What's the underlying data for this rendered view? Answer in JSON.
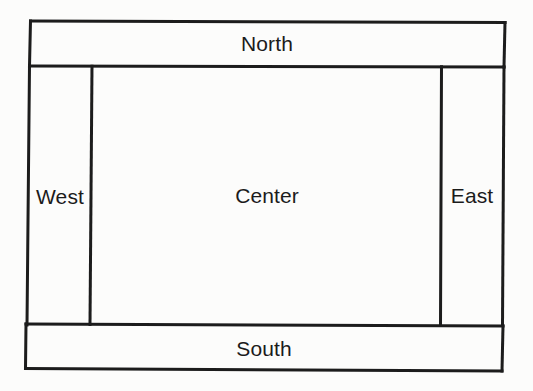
{
  "figure": {
    "background_color": "#fcfcfb",
    "stroke_color": "#1c1c1c",
    "text_color": "#1b1b1b",
    "stroke_width_px": 3
  },
  "regions": {
    "north": {
      "label": "North",
      "position": "top",
      "box": {
        "x": 30,
        "y": 21,
        "width": 475,
        "height": 45
      }
    },
    "west": {
      "label": "West",
      "position": "left",
      "box": {
        "x": 28,
        "y": 66,
        "width": 64,
        "height": 258
      }
    },
    "center": {
      "label": "Center",
      "position": "center",
      "box": {
        "x": 92,
        "y": 65,
        "width": 350,
        "height": 259
      }
    },
    "east": {
      "label": "East",
      "position": "right",
      "box": {
        "x": 441,
        "y": 65,
        "width": 62,
        "height": 259
      }
    },
    "south": {
      "label": "South",
      "position": "bottom",
      "box": {
        "x": 26,
        "y": 324,
        "width": 477,
        "height": 46
      }
    }
  },
  "order": [
    "north",
    "west",
    "center",
    "east",
    "south"
  ]
}
